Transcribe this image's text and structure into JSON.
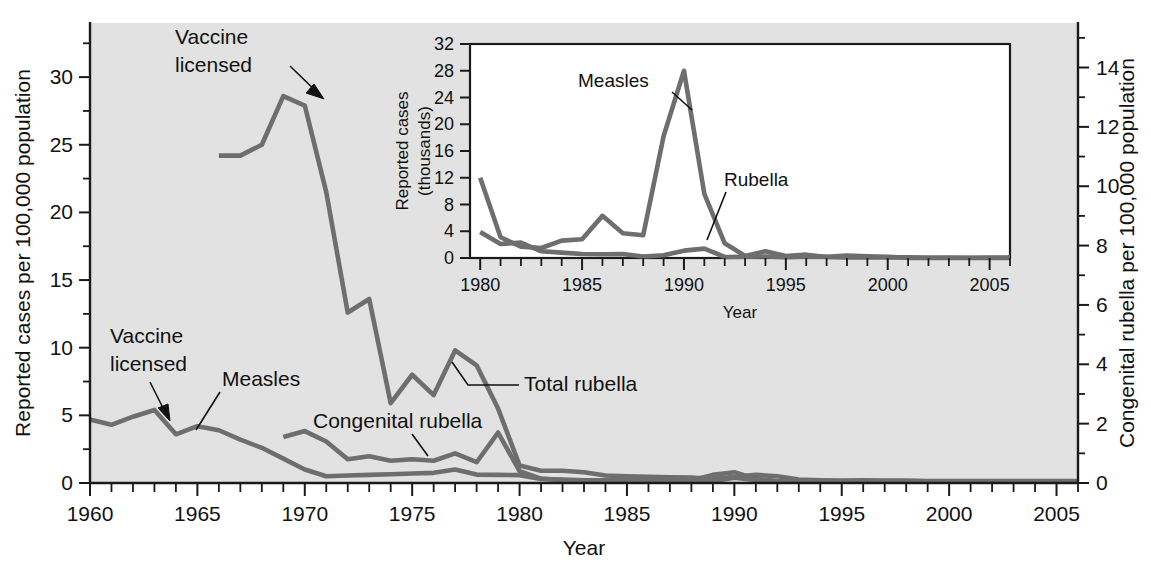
{
  "chart_data": {
    "type": "line",
    "title": "",
    "xlabel": "Year",
    "ylabel": "Reported cases per 100,000 population",
    "ylabel_right": "Congenital rubella per 100,000 population",
    "xlim": [
      1960,
      2006
    ],
    "ylim": [
      0,
      34
    ],
    "ylim_right": [
      0,
      15.5
    ],
    "grid": false,
    "legend": "inline-annotations",
    "xticks": [
      1960,
      1965,
      1970,
      1975,
      1980,
      1985,
      1990,
      1995,
      2000,
      2005
    ],
    "yticks": [
      0,
      5,
      10,
      15,
      20,
      25,
      30
    ],
    "yticks_right": [
      0,
      2,
      4,
      6,
      8,
      10,
      12,
      14
    ],
    "annotations": [
      {
        "text": "Vaccine licensed",
        "line1": "Vaccine",
        "line2": "licensed",
        "target_year": 1969,
        "target_value": 28.6
      },
      {
        "text": "Vaccine licensed",
        "line1": "Vaccine",
        "line2": "licensed",
        "target_year": 1963,
        "target_value": 4.2
      },
      {
        "text": "Measles",
        "target_year": 1965,
        "target_value": 3.1
      },
      {
        "text": "Congenital rubella",
        "target_year": 1975.5,
        "target_value": 1.3
      },
      {
        "text": "Total rubella",
        "target_year": 1978.5,
        "target_value": 8.2
      }
    ],
    "series": [
      {
        "name": "Measles",
        "axis": "left",
        "x": [
          1960,
          1961,
          1962,
          1963,
          1964,
          1965,
          1966,
          1967,
          1968,
          1969,
          1970,
          1971,
          1972,
          1973,
          1974,
          1975,
          1976,
          1977,
          1978,
          1979,
          1980,
          1981,
          1982,
          1983,
          1984,
          1985,
          1986,
          1987,
          1988,
          1989,
          1990,
          1991,
          1992,
          1993,
          1994,
          1995,
          1996,
          1997,
          1998,
          1999,
          2000,
          2001,
          2002,
          2003,
          2004,
          2005,
          2006
        ],
        "y": [
          4.7,
          4.3,
          4.9,
          5.4,
          3.6,
          4.2,
          3.9,
          3.2,
          2.6,
          1.8,
          1.0,
          0.5,
          0.55,
          0.6,
          0.65,
          0.7,
          0.75,
          1.0,
          0.62,
          0.6,
          0.58,
          0.3,
          0.25,
          0.2,
          0.22,
          0.3,
          0.35,
          0.25,
          0.2,
          0.6,
          0.8,
          0.3,
          0.15,
          0.1,
          0.12,
          0.1,
          0.1,
          0.1,
          0.1,
          0.1,
          0.1,
          0.1,
          0.1,
          0.1,
          0.1,
          0.1,
          0.1
        ]
      },
      {
        "name": "Total rubella",
        "axis": "left",
        "x": [
          1966,
          1967,
          1968,
          1969,
          1970,
          1971,
          1972,
          1973,
          1974,
          1975,
          1976,
          1977,
          1978,
          1979,
          1980,
          1981,
          1982,
          1983,
          1984,
          1985,
          1986,
          1987,
          1988,
          1989,
          1990,
          1991,
          1992,
          1993,
          1994,
          1995,
          1996,
          1997,
          1998,
          1999,
          2000,
          2001,
          2002,
          2003,
          2004,
          2005,
          2006
        ],
        "y": [
          24.2,
          24.2,
          25.0,
          28.6,
          27.9,
          21.5,
          12.6,
          13.6,
          5.9,
          8.0,
          6.5,
          9.8,
          8.7,
          5.5,
          1.3,
          0.9,
          0.9,
          0.8,
          0.55,
          0.5,
          0.45,
          0.42,
          0.4,
          0.3,
          0.45,
          0.6,
          0.5,
          0.25,
          0.2,
          0.18,
          0.2,
          0.18,
          0.18,
          0.15,
          0.15,
          0.15,
          0.15,
          0.15,
          0.15,
          0.15,
          0.15
        ]
      },
      {
        "name": "Congenital rubella",
        "axis": "right",
        "x": [
          1969,
          1970,
          1971,
          1972,
          1973,
          1974,
          1975,
          1976,
          1977,
          1978,
          1979,
          1980,
          1981,
          1982,
          1983,
          1984,
          1985,
          1986,
          1987,
          1988,
          1989,
          1990,
          1991,
          1992,
          1993,
          1994,
          1995,
          1996,
          1997,
          1998,
          1999,
          2000,
          2001,
          2002,
          2003,
          2004,
          2005,
          2006
        ],
        "y": [
          1.55,
          1.75,
          1.4,
          0.8,
          0.9,
          0.75,
          0.8,
          0.75,
          1.0,
          0.7,
          1.7,
          0.4,
          0.15,
          0.1,
          0.08,
          0.07,
          0.06,
          0.07,
          0.06,
          0.06,
          0.06,
          0.18,
          0.1,
          0.06,
          0.05,
          0.05,
          0.04,
          0.04,
          0.04,
          0.04,
          0.04,
          0.04,
          0.04,
          0.04,
          0.04,
          0.04,
          0.04,
          0.04
        ]
      }
    ],
    "inset": {
      "type": "line",
      "xlabel": "Year",
      "ylabel": "Reported cases (thousands)",
      "ylabel_line1": "Reported cases",
      "ylabel_line2": "(thousands)",
      "xlim": [
        1979.5,
        2006
      ],
      "ylim": [
        0,
        32
      ],
      "xticks": [
        1980,
        1985,
        1990,
        1995,
        2000,
        2005
      ],
      "yticks": [
        0,
        4,
        8,
        12,
        16,
        20,
        24,
        28,
        32
      ],
      "annotations": [
        {
          "text": "Measles",
          "target_year": 1989.2,
          "target_value": 22.0
        },
        {
          "text": "Rubella",
          "target_year": 1991.6,
          "target_value": 1.5
        }
      ],
      "series": [
        {
          "name": "Measles",
          "x": [
            1980,
            1981,
            1982,
            1983,
            1984,
            1985,
            1986,
            1987,
            1988,
            1989,
            1990,
            1991,
            1992,
            1993,
            1994,
            1995,
            1996,
            1997,
            1998,
            1999,
            2000,
            2001,
            2002,
            2003,
            2004,
            2005,
            2006
          ],
          "y": [
            12.0,
            3.1,
            1.7,
            1.5,
            2.6,
            2.8,
            6.3,
            3.7,
            3.4,
            18.2,
            28.0,
            9.6,
            2.2,
            0.3,
            1.0,
            0.3,
            0.5,
            0.14,
            0.1,
            0.1,
            0.09,
            0.12,
            0.04,
            0.06,
            0.04,
            0.07,
            0.06
          ]
        },
        {
          "name": "Rubella",
          "x": [
            1980,
            1981,
            1982,
            1983,
            1984,
            1985,
            1986,
            1987,
            1988,
            1989,
            1990,
            1991,
            1992,
            1993,
            1994,
            1995,
            1996,
            1997,
            1998,
            1999,
            2000,
            2001,
            2002,
            2003,
            2004,
            2005,
            2006
          ],
          "y": [
            3.9,
            2.1,
            2.3,
            1.0,
            0.8,
            0.6,
            0.55,
            0.6,
            0.22,
            0.4,
            1.1,
            1.4,
            0.16,
            0.19,
            0.23,
            0.13,
            0.24,
            0.18,
            0.36,
            0.27,
            0.18,
            0.02,
            0.02,
            0.01,
            0.01,
            0.01,
            0.01
          ]
        }
      ]
    }
  },
  "colors": {
    "plot_background": "#e2e2e2",
    "series_gray": "#6e6e6e",
    "axis_black": "#1a1a1a",
    "inset_background": "#ffffff"
  }
}
